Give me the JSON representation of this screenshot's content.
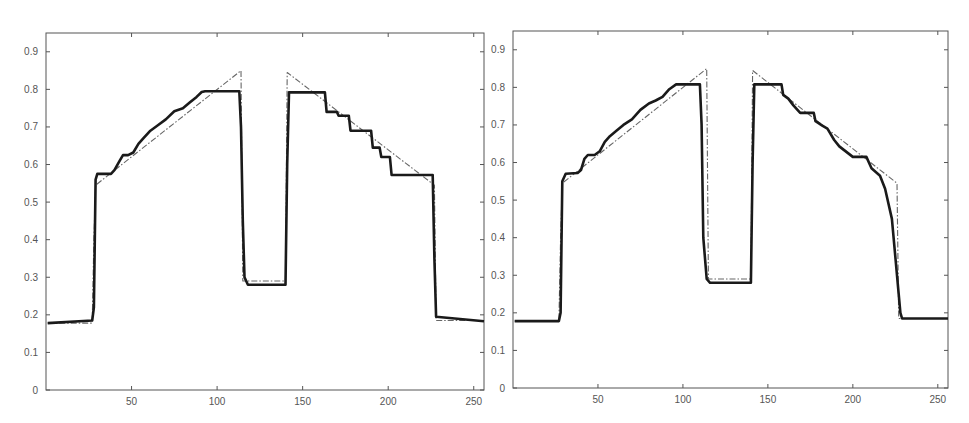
{
  "figure": {
    "panels": 2,
    "background": "#ffffff",
    "axis_color": "#555555",
    "line_color": "#1a1a1a",
    "ref_color": "#666666"
  },
  "chart_data": [
    {
      "type": "line",
      "title": "",
      "xlabel": "",
      "ylabel": "",
      "xlim": [
        0,
        256
      ],
      "ylim": [
        0,
        0.95
      ],
      "xticks": [
        50,
        100,
        150,
        200,
        250
      ],
      "yticks": [
        0,
        0.1,
        0.2,
        0.3,
        0.4,
        0.5,
        0.6,
        0.7,
        0.8,
        0.9
      ],
      "ytick_labels": [
        "0",
        "0.1",
        "0.2",
        "0.3",
        "0.4",
        "0.5",
        "0.6",
        "0.7",
        "0.8",
        "0.9"
      ],
      "xtick_labels": [
        "50",
        "100",
        "150",
        "200",
        "250"
      ],
      "grid": false,
      "legend": null,
      "series": [
        {
          "name": "reconstruction",
          "style": "solid-thick",
          "x": [
            1,
            27,
            28,
            29,
            30,
            38,
            40,
            43,
            45,
            48,
            51,
            54,
            57,
            61,
            65,
            70,
            75,
            80,
            84,
            88,
            91,
            93,
            95,
            97,
            113,
            114,
            115,
            116,
            118,
            121,
            140,
            141,
            142,
            163,
            164,
            170,
            171,
            177,
            178,
            190,
            191,
            195,
            196,
            201,
            202,
            212,
            213,
            226,
            227,
            228,
            256
          ],
          "y": [
            0.178,
            0.185,
            0.22,
            0.56,
            0.575,
            0.575,
            0.585,
            0.61,
            0.625,
            0.625,
            0.632,
            0.655,
            0.67,
            0.69,
            0.703,
            0.72,
            0.742,
            0.75,
            0.765,
            0.78,
            0.793,
            0.795,
            0.795,
            0.795,
            0.795,
            0.7,
            0.45,
            0.3,
            0.28,
            0.28,
            0.28,
            0.6,
            0.792,
            0.792,
            0.74,
            0.74,
            0.73,
            0.73,
            0.69,
            0.69,
            0.645,
            0.645,
            0.62,
            0.62,
            0.572,
            0.572,
            0.572,
            0.572,
            0.35,
            0.195,
            0.183
          ]
        },
        {
          "name": "reference",
          "style": "dash-dot",
          "x": [
            1,
            27,
            28,
            29,
            114,
            115,
            116,
            139,
            140,
            141,
            227,
            228,
            256
          ],
          "y": [
            0.178,
            0.178,
            0.4,
            0.545,
            0.85,
            0.29,
            0.29,
            0.29,
            0.29,
            0.845,
            0.545,
            0.185,
            0.185
          ]
        }
      ]
    },
    {
      "type": "line",
      "title": "",
      "xlabel": "",
      "ylabel": "",
      "xlim": [
        0,
        256
      ],
      "ylim": [
        0,
        0.95
      ],
      "xticks": [
        50,
        100,
        150,
        200,
        250
      ],
      "yticks": [
        0,
        0.1,
        0.2,
        0.3,
        0.4,
        0.5,
        0.6,
        0.7,
        0.8,
        0.9
      ],
      "ytick_labels": [
        "0",
        "0.1",
        "0.2",
        "0.3",
        "0.4",
        "0.5",
        "0.6",
        "0.7",
        "0.8",
        "0.9"
      ],
      "xtick_labels": [
        "50",
        "100",
        "150",
        "200",
        "250"
      ],
      "grid": false,
      "legend": null,
      "series": [
        {
          "name": "reconstruction",
          "style": "solid-thick",
          "x": [
            1,
            27,
            28,
            29,
            31,
            38,
            40,
            42,
            44,
            48,
            51,
            54,
            57,
            61,
            65,
            70,
            75,
            80,
            84,
            88,
            92,
            96,
            100,
            102,
            110,
            111,
            112,
            114,
            116,
            121,
            140,
            141,
            142,
            158,
            159,
            162,
            165,
            169,
            172,
            177,
            178,
            182,
            185,
            189,
            192,
            200,
            201,
            208,
            211,
            216,
            219,
            223,
            225,
            227,
            228,
            229,
            256
          ],
          "y": [
            0.178,
            0.178,
            0.2,
            0.55,
            0.57,
            0.572,
            0.58,
            0.61,
            0.62,
            0.62,
            0.63,
            0.655,
            0.67,
            0.685,
            0.7,
            0.715,
            0.74,
            0.757,
            0.765,
            0.775,
            0.795,
            0.808,
            0.808,
            0.808,
            0.808,
            0.7,
            0.4,
            0.29,
            0.28,
            0.28,
            0.28,
            0.6,
            0.808,
            0.808,
            0.78,
            0.77,
            0.752,
            0.732,
            0.732,
            0.732,
            0.71,
            0.698,
            0.69,
            0.66,
            0.643,
            0.615,
            0.615,
            0.615,
            0.585,
            0.565,
            0.53,
            0.45,
            0.35,
            0.25,
            0.2,
            0.185,
            0.185
          ]
        },
        {
          "name": "reference",
          "style": "dash-dot",
          "x": [
            1,
            27,
            28,
            29,
            114,
            115,
            116,
            139,
            140,
            141,
            226,
            227,
            228,
            256
          ],
          "y": [
            0.178,
            0.178,
            0.4,
            0.545,
            0.85,
            0.29,
            0.29,
            0.29,
            0.29,
            0.845,
            0.545,
            0.185,
            0.185,
            0.185
          ]
        }
      ]
    }
  ],
  "panels_layout": [
    {
      "left": 46,
      "top": 33,
      "right": 484,
      "bottom": 390
    },
    {
      "left": 513,
      "top": 31,
      "right": 948,
      "bottom": 388
    }
  ]
}
